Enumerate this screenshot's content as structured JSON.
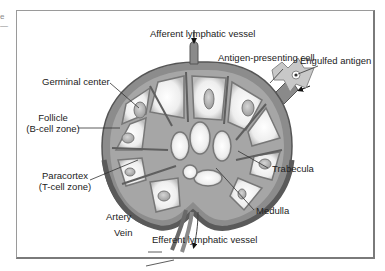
{
  "edge_fragment": [
    "e",
    "—"
  ],
  "diagram": {
    "labels": {
      "afferent": "Afferent lymphatic vessel",
      "apc": "Antigen-presenting cell",
      "engulfed": "Engulfed antigen",
      "germinal": "Germinal center",
      "follicle_1": "Follicle",
      "follicle_2": "(B-cell zone)",
      "paracortex_1": "Paracortex",
      "paracortex_2": "(T-cell zone)",
      "trabecula": "Trabecula",
      "medulla": "Medulla",
      "artery": "Artery",
      "vein": "Vein",
      "efferent": "Efferent lymphatic vessel"
    },
    "colors": {
      "capsule": "#6e6e6e",
      "cortex": "#9a9a9a",
      "follicle_fill": "#f2f2f2",
      "germinal_fill": "#b5b5b5",
      "apc_fill": "#c8c8c8",
      "frame": "#8c8c8c"
    }
  }
}
